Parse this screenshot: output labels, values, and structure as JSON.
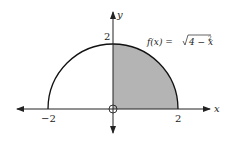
{
  "figure": {
    "function_label": "f(x) = √4 − x²",
    "function_parts": {
      "lhs": "f(x) = ",
      "radicand": "4 − x",
      "exponent": "2"
    },
    "x_axis_label": "x",
    "y_axis_label": "y",
    "x_ticks": [
      {
        "value": -2,
        "label": "−2"
      },
      {
        "value": 2,
        "label": "2"
      }
    ],
    "y_ticks": [
      {
        "value": 2,
        "label": "2"
      }
    ],
    "shaded_region": "0 ≤ x ≤ 2 under f(x)",
    "colors": {
      "curve": "#111111",
      "shade": "#b4b4b4",
      "axis": "#222222"
    }
  }
}
